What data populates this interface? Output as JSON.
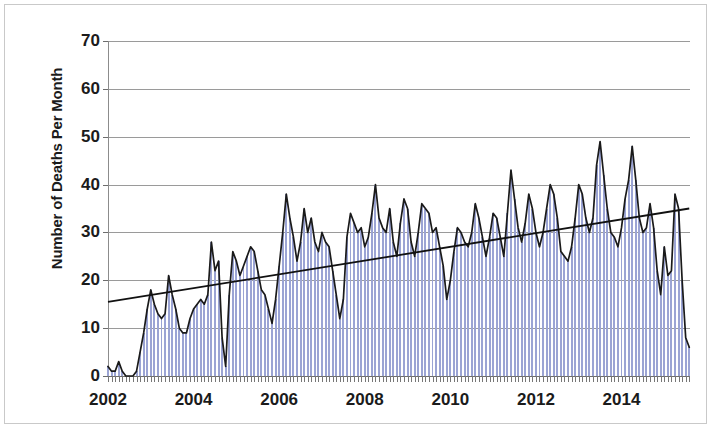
{
  "chart_data": {
    "type": "bar",
    "title": "",
    "subtitle": "",
    "xlabel": "",
    "ylabel": "Number of Deaths Per Month",
    "ylim": [
      0,
      70
    ],
    "ytick_values": [
      0,
      10,
      20,
      30,
      40,
      50,
      60,
      70
    ],
    "ytick_labels": [
      "0",
      "10",
      "20",
      "30",
      "40",
      "50",
      "60",
      "70"
    ],
    "xtick_values": [
      2002,
      2004,
      2006,
      2008,
      2010,
      2012,
      2014
    ],
    "xtick_labels": [
      "2002",
      "2004",
      "2006",
      "2008",
      "2010",
      "2012",
      "2014"
    ],
    "xlim": [
      2002.0,
      2015.6
    ],
    "grid": "horizontal",
    "legend": "none",
    "x_start_year": 2002.0,
    "x_step_years": 0.08333,
    "bar_color": "#9ba4d4",
    "line_color": "#1a1a1a",
    "trendline_color": "#111111",
    "series": [
      {
        "name": "Number of Deaths Per Month",
        "kind": "bars-and-line",
        "values": [
          2,
          1,
          1,
          3,
          1,
          0,
          0,
          0,
          1,
          5,
          9,
          14,
          18,
          15,
          13,
          12,
          13,
          21,
          17,
          14,
          10,
          9,
          9,
          12,
          14,
          15,
          16,
          15,
          17,
          28,
          22,
          24,
          8,
          2,
          17,
          26,
          24,
          21,
          23,
          25,
          27,
          26,
          22,
          18,
          17,
          14,
          11,
          16,
          23,
          30,
          38,
          33,
          29,
          24,
          28,
          35,
          30,
          33,
          28,
          26,
          30,
          28,
          27,
          22,
          17,
          12,
          16,
          29,
          34,
          32,
          30,
          31,
          27,
          29,
          34,
          40,
          33,
          31,
          30,
          35,
          28,
          25,
          32,
          37,
          35,
          28,
          25,
          30,
          36,
          35,
          34,
          30,
          31,
          27,
          23,
          16,
          20,
          26,
          31,
          30,
          28,
          27,
          30,
          36,
          33,
          29,
          25,
          29,
          34,
          33,
          29,
          25,
          34,
          43,
          37,
          31,
          28,
          32,
          38,
          35,
          30,
          27,
          30,
          35,
          40,
          38,
          33,
          26,
          25,
          24,
          27,
          33,
          40,
          38,
          33,
          30,
          33,
          44,
          49,
          42,
          35,
          30,
          29,
          27,
          31,
          37,
          41,
          48,
          41,
          33,
          30,
          31,
          36,
          31,
          22,
          17,
          27,
          21,
          22,
          38,
          35,
          20,
          8,
          6
        ]
      }
    ],
    "trendline": {
      "name": "Linear trend",
      "y_start": 15.5,
      "y_end": 35.0,
      "description": "Rising linear trendline from about 15.5 in 2002 to about 35 in 2015"
    }
  }
}
